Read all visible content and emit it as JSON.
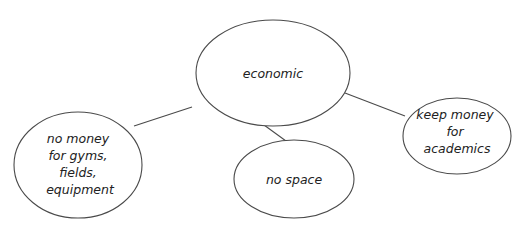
{
  "diagram": {
    "type": "concept-map",
    "central_node": {
      "id": "economic",
      "label_lines": [
        "economic"
      ]
    },
    "nodes": [
      {
        "id": "no-money-sports",
        "label_lines": [
          "no money",
          "for gyms,",
          "fields,",
          "equipment"
        ]
      },
      {
        "id": "no-space",
        "label_lines": [
          "no space"
        ]
      },
      {
        "id": "keep-money-academics",
        "label_lines": [
          "keep money",
          "for",
          "academics"
        ]
      }
    ],
    "edges": [
      {
        "from": "economic",
        "to": "no-money-sports"
      },
      {
        "from": "economic",
        "to": "no-space"
      },
      {
        "from": "economic",
        "to": "keep-money-academics"
      }
    ],
    "colors": {
      "stroke": "#4a4a4a",
      "text": "#222222",
      "background": "#ffffff"
    }
  }
}
